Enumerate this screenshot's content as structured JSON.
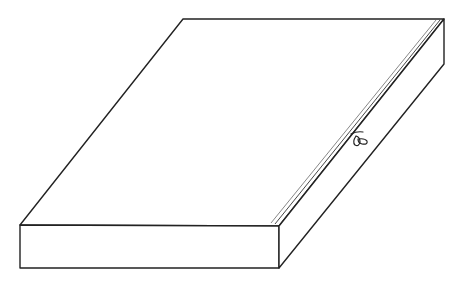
{
  "diagram": {
    "stroke_color": "#222222",
    "background": "#ffffff",
    "vertices": {
      "top_back_left": [
        183,
        19
      ],
      "top_back_right": [
        444,
        19
      ],
      "top_front_left": [
        20,
        225
      ],
      "top_front_right": [
        279,
        226
      ],
      "bottom_front_left": [
        20,
        268
      ],
      "bottom_front_right": [
        279,
        268
      ],
      "bottom_back_right": [
        444,
        64
      ]
    },
    "seam": {
      "description": "double line along top-right edge",
      "start": [
        276,
        223
      ],
      "end": [
        441,
        22
      ]
    },
    "mark": {
      "description": "small handwritten loop/bow mark on right edge",
      "position": [
        355,
        138
      ]
    }
  }
}
